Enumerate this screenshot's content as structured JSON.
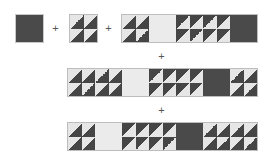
{
  "operator": "+",
  "colors": {
    "dark": "#454545",
    "light": "#e6e6e6",
    "blank": "#ebebeb"
  },
  "legend": {
    "A": "half-square triangle, light top-left / dark bottom-right",
    "B": "half-square triangle, dark top-left / light bottom-right"
  },
  "rows": [
    {
      "id": "row1",
      "terms": [
        "dark-square",
        "A-2x2",
        "strip: A-2x2 | blank | B-4x2 | dark"
      ]
    },
    {
      "id": "row2",
      "strip": [
        "A-4x2",
        "blank",
        "B-4x2",
        "dark",
        "A-2x2"
      ]
    },
    {
      "id": "row3",
      "strip": [
        "A-2x2",
        "blank",
        "B-4x2",
        "dark",
        "A-4x2"
      ]
    }
  ]
}
